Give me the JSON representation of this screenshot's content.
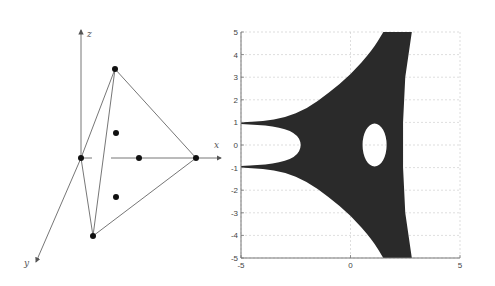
{
  "figure": {
    "left_panel": {
      "type": "3d-diagram",
      "axis_labels": {
        "x": "x",
        "y": "y",
        "z": "z"
      },
      "description": "Tetrahedron with vertices on coordinate axes; marked points",
      "colors": {
        "line": "#666666",
        "dot": "#111111"
      }
    },
    "right_panel": {
      "colors": {
        "fill": "#2a2a2a",
        "grid": "#c8c8c8",
        "axis": "#777777"
      }
    }
  },
  "chart_data": {
    "type": "region",
    "title": "",
    "xlabel": "",
    "ylabel": "",
    "xlim": [
      -5,
      5
    ],
    "ylim": [
      -5,
      5
    ],
    "x_ticks": [
      "-5",
      "0",
      "5"
    ],
    "y_ticks": [
      "5",
      "4",
      "3",
      "2",
      "1",
      "0",
      "-1",
      "-2",
      "-3",
      "-4",
      "-5"
    ],
    "grid": true,
    "legend": "none",
    "region": {
      "description": "Filled three-armed region (hyperbolic triangle shape) with an elliptic hole",
      "outer_boundary": [
        [
          -5,
          1.0
        ],
        [
          -4,
          1.05
        ],
        [
          -3,
          1.2
        ],
        [
          -2,
          1.6
        ],
        [
          -1,
          2.3
        ],
        [
          0,
          3.1
        ],
        [
          1,
          4.2
        ],
        [
          1.5,
          5.0
        ],
        [
          2.8,
          5.0
        ],
        [
          2.5,
          3.0
        ],
        [
          2.4,
          1.0
        ],
        [
          2.4,
          -1.0
        ],
        [
          2.5,
          -3.0
        ],
        [
          2.8,
          -5.0
        ],
        [
          1.5,
          -5.0
        ],
        [
          1,
          -4.2
        ],
        [
          0,
          -3.1
        ],
        [
          -1,
          -2.3
        ],
        [
          -2,
          -1.6
        ],
        [
          -3,
          -1.2
        ],
        [
          -4,
          -1.05
        ],
        [
          -5,
          -1.0
        ]
      ],
      "inner_arm_gap": [
        [
          -5,
          0.93
        ],
        [
          -3.5,
          0.85
        ],
        [
          -2.5,
          0.55
        ],
        [
          -2.2,
          0
        ],
        [
          -2.5,
          -0.55
        ],
        [
          -3.5,
          -0.85
        ],
        [
          -5,
          -0.93
        ]
      ],
      "hole": {
        "center": [
          1.1,
          0.0
        ],
        "rx": 0.55,
        "ry": 0.95
      }
    }
  }
}
